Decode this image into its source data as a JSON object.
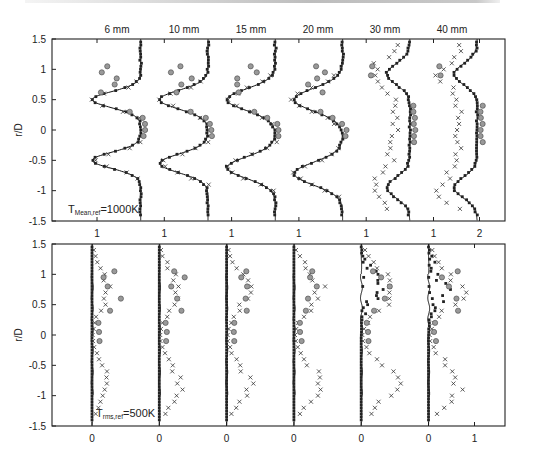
{
  "chart_data": [
    {
      "type": "line",
      "panel": "top",
      "title": "",
      "annotation": "T_Mean,ref =1000K",
      "annotation_main": "T",
      "annotation_sub": "Mean,ref",
      "annotation_rest": "=1000K",
      "ylabel": "r/D",
      "ylim": [
        -1.5,
        1.5
      ],
      "yticks": [
        "1.5",
        "1",
        "0.5",
        "0",
        "-0.5",
        "-1",
        "-1.5"
      ],
      "columns": [
        "6 mm",
        "10 mm",
        "15 mm",
        "20 mm",
        "30 mm",
        "40 mm"
      ],
      "xtick_labels": [
        "1",
        "1",
        "1",
        "1",
        "1",
        "1",
        "2"
      ],
      "series": [
        {
          "name": "simulation",
          "style": "solid line"
        },
        {
          "name": "experiment A",
          "style": "small squares"
        },
        {
          "name": "experiment B",
          "style": "crosses"
        },
        {
          "name": "experiment C",
          "style": "gray circles"
        }
      ],
      "profiles_line": {
        "6 mm": {
          "edge": 1.95,
          "min": 0.95,
          "pos_peak": 0.5,
          "neg_peak": -0.5,
          "width": 0.12
        },
        "10 mm": {
          "edge": 1.95,
          "min": 0.9,
          "pos_peak": 0.5,
          "neg_peak": -0.55,
          "width": 0.14
        },
        "15 mm": {
          "edge": 1.95,
          "min": 0.9,
          "pos_peak": 0.5,
          "neg_peak": -0.62,
          "width": 0.16
        },
        "20 mm": {
          "edge": 1.95,
          "min": 0.9,
          "pos_peak": 0.5,
          "neg_peak": -0.72,
          "width": 0.17
        },
        "30 mm": {
          "edge": 1.95,
          "min": 1.45,
          "pos_peak": 0.92,
          "neg_peak": -0.95,
          "width": 0.17
        },
        "40 mm": {
          "edge": 1.95,
          "min": 1.45,
          "pos_peak": 0.92,
          "neg_peak": -0.95,
          "width": 0.17
        }
      }
    },
    {
      "type": "line",
      "panel": "bottom",
      "annotation": "T_rms,ref =500K",
      "annotation_main": "T",
      "annotation_sub": "rms,ref",
      "annotation_rest": "=500K",
      "ylabel": "r/D",
      "ylim": [
        -1.5,
        1.5
      ],
      "yticks": [
        "1.5",
        "1",
        "0.5",
        "0",
        "-0.5",
        "-1",
        "-1.5"
      ],
      "xtick_labels": [
        "0",
        "0",
        "0",
        "0",
        "0",
        "0",
        "1"
      ],
      "series": [
        {
          "name": "simulation",
          "style": "solid line (near 0)"
        },
        {
          "name": "experiment A",
          "style": "small squares"
        },
        {
          "name": "experiment B",
          "style": "crosses"
        },
        {
          "name": "experiment C",
          "style": "gray circles"
        }
      ]
    }
  ],
  "labels": {
    "ylabel": "r/D",
    "top_columns": [
      "6 mm",
      "10 mm",
      "15 mm",
      "20 mm",
      "30 mm",
      "40 mm"
    ],
    "yticks": [
      "1.5",
      "1",
      "0.5",
      "0",
      "-0.5",
      "-1",
      "-1.5"
    ],
    "top_xticks": [
      "1",
      "1",
      "1",
      "1",
      "1",
      "1",
      "2"
    ],
    "bottom_xticks": [
      "0",
      "0",
      "0",
      "0",
      "0",
      "0",
      "1"
    ],
    "top_ann_main": "T",
    "top_ann_sub": "Mean,ref",
    "top_ann_rest": "=1000K",
    "bot_ann_main": "T",
    "bot_ann_sub": "rms,ref",
    "bot_ann_rest": "=500K"
  }
}
